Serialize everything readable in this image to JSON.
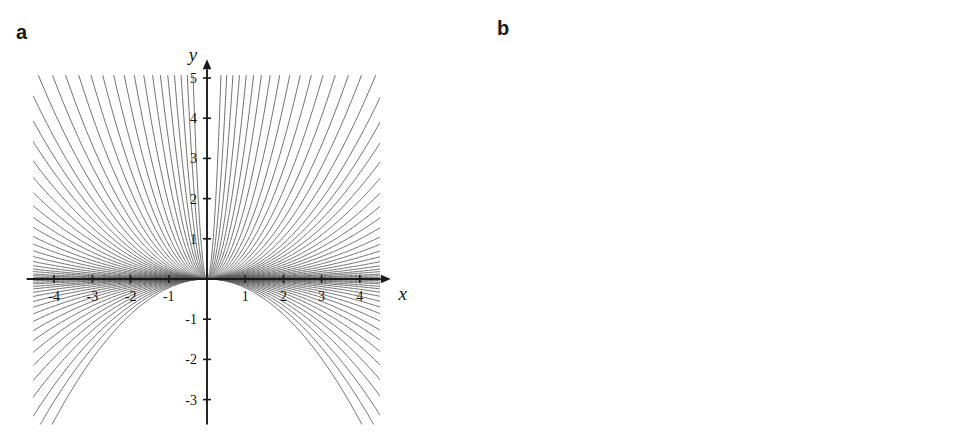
{
  "figure": {
    "width": 964,
    "height": 445,
    "background": "#ffffff",
    "curve_color": "#555555",
    "axis_color": "#1a1a1a",
    "mesh_color": "#2b2b2b"
  },
  "panels": {
    "a": {
      "letter": "a",
      "axis_x_name": "x",
      "axis_y_name": "y"
    },
    "b": {
      "letter": "b",
      "axis_x_name": "x",
      "axis_y_name": "t",
      "axis_z_name": "z"
    }
  },
  "chart_data": [
    {
      "type": "line",
      "panel": "a",
      "title": "",
      "xlabel": "x",
      "ylabel": "y",
      "xlim": [
        -4.6,
        4.6
      ],
      "ylim": [
        -3.6,
        5.2
      ],
      "grid": false,
      "legend": "none",
      "xticks": [
        -4,
        -3,
        -2,
        -1,
        1,
        2,
        3,
        4
      ],
      "xtick_labels": [
        "-4",
        "-3",
        "-2",
        "-1",
        "1",
        "2",
        "3",
        "4"
      ],
      "yticks": [
        5,
        4,
        3,
        2,
        1,
        -1,
        -2,
        -3
      ],
      "ytick_labels": [
        "5",
        "4",
        "3",
        "2",
        "1",
        "-1",
        "-2",
        "-3"
      ],
      "description": "Family of parabolas y = t x^2 for a sweep of parameter t, all through the origin; positive t open upward, negative t open downward.",
      "family": {
        "formula": "y = t * x^2",
        "parameter": "t",
        "t_values": [
          -0.22,
          -0.19,
          -0.165,
          -0.142,
          -0.122,
          -0.104,
          -0.088,
          -0.074,
          -0.062,
          -0.051,
          -0.042,
          -0.034,
          -0.027,
          -0.021,
          -0.016,
          -0.012,
          -0.009,
          -0.006,
          -0.004,
          -0.002,
          0.002,
          0.004,
          0.006,
          0.009,
          0.012,
          0.016,
          0.021,
          0.027,
          0.034,
          0.042,
          0.051,
          0.062,
          0.074,
          0.088,
          0.104,
          0.122,
          0.142,
          0.165,
          0.19,
          0.22,
          0.26,
          0.31,
          0.37,
          0.45,
          0.55,
          0.68,
          0.85,
          1.08,
          1.4,
          1.85,
          2.5,
          3.4,
          4.8,
          7.0,
          11.0,
          19.0,
          38.0
        ]
      }
    },
    {
      "type": "surface",
      "panel": "b",
      "title": "",
      "xlabel": "x",
      "ylabel": "t",
      "zlabel": "z",
      "grid": false,
      "legend": "none",
      "xticks": [
        -4,
        -2,
        0,
        2,
        4
      ],
      "xtick_labels": [
        "-4",
        "-2",
        "0",
        "2",
        "4"
      ],
      "tticks": [
        2,
        0,
        -2,
        -4
      ],
      "ttick_labels": [
        "2",
        "0",
        "-2",
        "-4"
      ],
      "zticks": [
        0,
        10,
        20,
        30,
        40,
        50
      ],
      "ztick_labels": [
        "0",
        "10",
        "20",
        "30",
        "40",
        "50"
      ],
      "xlim": [
        -5,
        5
      ],
      "tlim": [
        -5,
        3
      ],
      "zlim": [
        0,
        55
      ],
      "description": "3D mesh surface z = t * x^2 rendered in grey shading; rises steeply at the back-left, saddles down toward the right.",
      "formula": "z = t * x^2",
      "mesh_divisions": 16,
      "shading": {
        "light": "#e8e8e8",
        "mid": "#b0b0b0",
        "dark": "#7d7d7d"
      }
    }
  ]
}
